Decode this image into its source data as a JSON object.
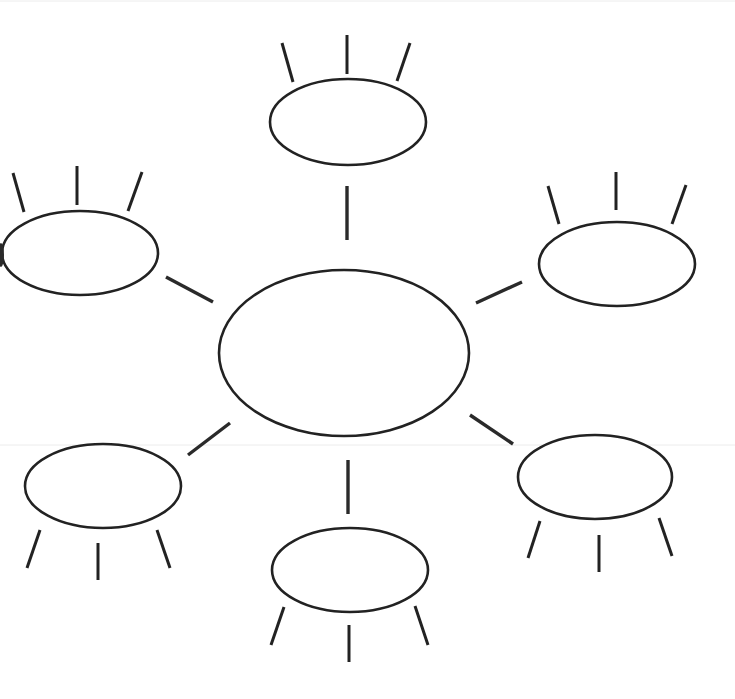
{
  "diagram": {
    "type": "bubble-map",
    "canvas": {
      "width": 735,
      "height": 699,
      "background": "#ffffff",
      "stroke": "#222222"
    },
    "center": {
      "id": "center",
      "label": "",
      "cx": 344,
      "cy": 353,
      "rx": 125,
      "ry": 83
    },
    "nodes": [
      {
        "id": "top",
        "label": "",
        "cx": 348,
        "cy": 122,
        "rx": 78,
        "ry": 43,
        "connector": [
          347,
          186,
          347,
          240
        ],
        "spokes": [
          [
            282,
            43,
            293,
            82
          ],
          [
            347,
            35,
            347,
            74
          ],
          [
            410,
            43,
            397,
            81
          ]
        ]
      },
      {
        "id": "upper-left",
        "label": "",
        "cx": 80,
        "cy": 253,
        "rx": 78,
        "ry": 42,
        "connector": [
          166,
          277,
          213,
          302
        ],
        "spokes": [
          [
            13,
            173,
            24,
            212
          ],
          [
            77,
            166,
            77,
            205
          ],
          [
            142,
            172,
            128,
            211
          ]
        ]
      },
      {
        "id": "upper-right",
        "label": "",
        "cx": 617,
        "cy": 264,
        "rx": 78,
        "ry": 42,
        "connector": [
          476,
          303,
          522,
          282
        ],
        "spokes": [
          [
            548,
            186,
            559,
            224
          ],
          [
            616,
            172,
            616,
            210
          ],
          [
            686,
            185,
            672,
            224
          ]
        ]
      },
      {
        "id": "lower-left",
        "label": "",
        "cx": 103,
        "cy": 486,
        "rx": 78,
        "ry": 42,
        "connector": [
          188,
          455,
          230,
          423
        ],
        "spokes": [
          [
            40,
            530,
            27,
            568
          ],
          [
            98,
            543,
            98,
            580
          ],
          [
            157,
            530,
            170,
            568
          ]
        ]
      },
      {
        "id": "lower-right",
        "label": "",
        "cx": 595,
        "cy": 477,
        "rx": 77,
        "ry": 42,
        "connector": [
          470,
          415,
          513,
          444
        ],
        "spokes": [
          [
            540,
            521,
            528,
            558
          ],
          [
            599,
            535,
            599,
            572
          ],
          [
            659,
            518,
            672,
            556
          ]
        ]
      },
      {
        "id": "bottom",
        "label": "",
        "cx": 350,
        "cy": 570,
        "rx": 78,
        "ry": 42,
        "connector": [
          348,
          460,
          348,
          514
        ],
        "spokes": [
          [
            284,
            607,
            271,
            645
          ],
          [
            349,
            625,
            349,
            662
          ],
          [
            415,
            606,
            428,
            645
          ]
        ]
      }
    ],
    "artifacts": {
      "scan_lines_y": [
        1,
        445
      ],
      "edge_blot": {
        "cx": 1,
        "cy": 255,
        "rx": 3,
        "ry": 12
      }
    }
  }
}
